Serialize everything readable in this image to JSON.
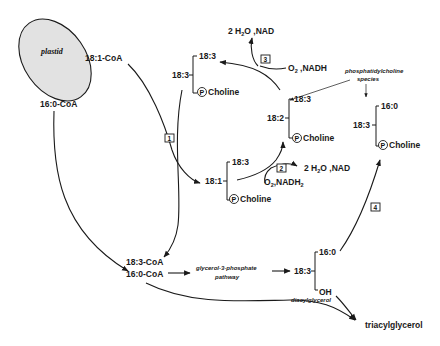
{
  "diagram": {
    "plastid_label": "plastid",
    "coa": {
      "c18_1": "18:1-CoA",
      "c16_0": "16:0-CoA",
      "c18_3": "18:3-CoA",
      "c16_0_b": "16:0-CoA"
    },
    "pc_181": {
      "sn2": "18:1",
      "sn1": "18:3",
      "head": "Choline"
    },
    "pc_183": {
      "sn2": "18:3",
      "sn1": "18:3",
      "head": "Choline"
    },
    "pc_182": {
      "sn2": "18:2",
      "sn1": "18:3",
      "head": "Choline"
    },
    "pc_160": {
      "sn2": "18:3",
      "sn1": "16:0",
      "head": "Choline"
    },
    "dag": {
      "sn2": "18:3",
      "sn1": "16:0",
      "sn3": "OH",
      "label": "diacylglycerol"
    },
    "phospho_symbol": "P",
    "steps": [
      "1",
      "2",
      "3",
      "4"
    ],
    "step2": {
      "in_a": "O",
      "in_sub": "2",
      "in_b": ",NADH",
      "in_sub2": "2",
      "out_a": "2 H",
      "out_sub": "2",
      "out_b": "O ,NAD"
    },
    "step3": {
      "in_a": "O",
      "in_sub": "2",
      "in_b": " ,NADH",
      "out_a": "2 H",
      "out_sub": "2",
      "out_b": "O ,NAD"
    },
    "pc_species_label_1": "phosphatidylcholine",
    "pc_species_label_2": "species",
    "g3p_label_1": "glycerol-3-phosphate",
    "g3p_label_2": "pathway",
    "tag_label": "triacylglycerol"
  }
}
